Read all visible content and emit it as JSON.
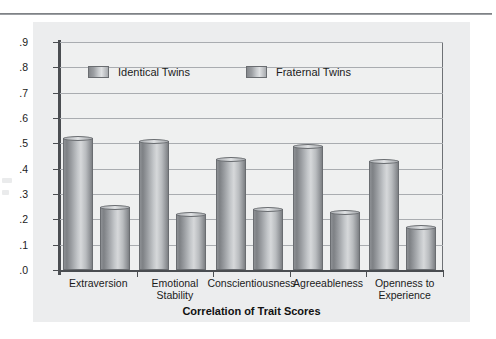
{
  "chart_data": {
    "type": "bar",
    "title": "",
    "xlabel": "Correlation of Trait Scores",
    "ylabel": "",
    "categories": [
      "Extraversion",
      "Emotional\nStability",
      "Conscientiousness",
      "Agreeableness",
      "Openness to\nExperience"
    ],
    "series": [
      {
        "name": "Identical Twins",
        "values": [
          0.52,
          0.51,
          0.44,
          0.49,
          0.43
        ]
      },
      {
        "name": "Fraternal Twins",
        "values": [
          0.25,
          0.22,
          0.24,
          0.23,
          0.17
        ]
      }
    ],
    "ylim": [
      0.0,
      0.9
    ],
    "ytick_labels": [
      ".9",
      ".8",
      ".7",
      ".6",
      ".5",
      ".4",
      ".3",
      ".2",
      ".1",
      ".0"
    ],
    "ytick_values": [
      0.9,
      0.8,
      0.7,
      0.6,
      0.5,
      0.4,
      0.3,
      0.2,
      0.1,
      0.0
    ],
    "grid": true,
    "legend_position": "top-inside",
    "bar_style": "cylinder-gradient",
    "colors": {
      "bar_fill_light": "#d6d8da",
      "bar_fill_dark": "#7e8185",
      "bar_border": "#6a6d71",
      "panel_background": "#ecedee",
      "plot_background": "#eff0f0",
      "gridline": "#a9acb0",
      "axis": "#4a4d51",
      "text": "#1b1b1b"
    }
  },
  "legend": {
    "items": [
      {
        "label": "Identical Twins"
      },
      {
        "label": "Fraternal Twins"
      }
    ]
  },
  "axis_title": "Correlation of Trait Scores"
}
